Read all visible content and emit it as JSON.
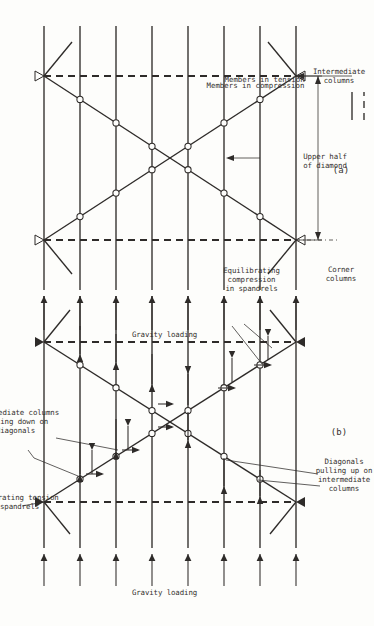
{
  "figure": {
    "title_absent": true,
    "panels": [
      {
        "id": "a",
        "label": "(a)",
        "loading_label": "Gravity loading",
        "callouts": [
          {
            "name": "corner-columns",
            "text": "Corner\ncolumns"
          },
          {
            "name": "intermediate-columns",
            "text": "Intermediate\ncolumns"
          },
          {
            "name": "upper-half-of-diamond",
            "text": "Upper half\nof diamond"
          }
        ]
      },
      {
        "id": "b",
        "label": "(b)",
        "loading_label": "Gravity loading",
        "callouts": [
          {
            "name": "equilibrating-tension-spandrels",
            "text": "Equilibrating tension\nin spandrels"
          },
          {
            "name": "intermediate-columns-pulling-down",
            "text": "Intermediate columns\npulling down on\ndiagonals"
          },
          {
            "name": "diagonals-pulling-up",
            "text": "Diagonals\npulling up on\nintermediate\ncolumns"
          },
          {
            "name": "equilibrating-compression-spandrels",
            "text": "Equilibrating\ncompression\nin spandrels"
          }
        ]
      }
    ],
    "legend": {
      "title_absent": true,
      "items": [
        {
          "name": "members-in-compression",
          "style": "solid",
          "text": "Members in compression"
        },
        {
          "name": "members-in-tension",
          "style": "dashed",
          "text": "Members in tension"
        }
      ]
    },
    "colors": {
      "ink": "#2e2b29",
      "text": "#35312f",
      "paper": "#fdfdfb"
    },
    "geometry_note": "Braced-tube diagrid frame: 8 horizontal spandrel levels, 2 corner columns (dashed = tension), X diagonals with circular node joints at intermediate columns."
  }
}
